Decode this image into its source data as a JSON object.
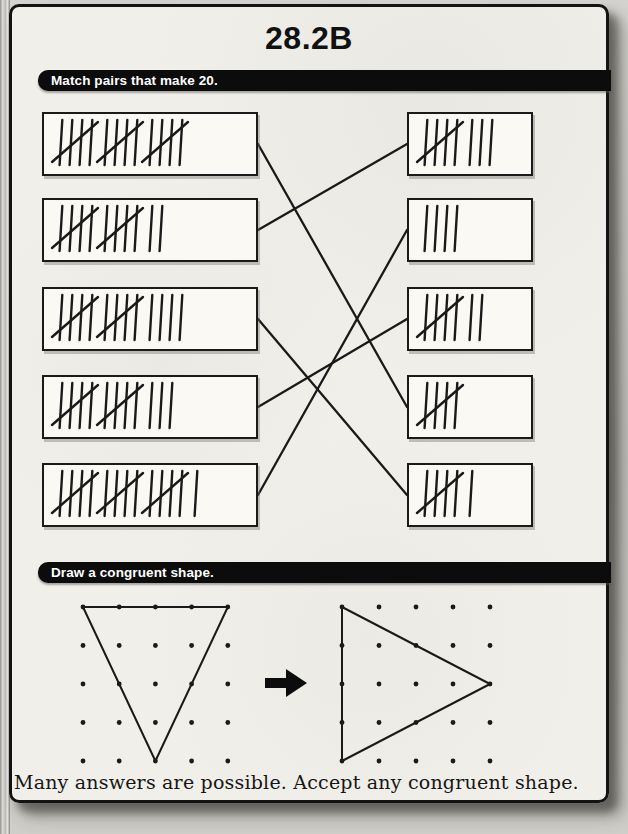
{
  "page": {
    "title": "28.2B"
  },
  "sections": {
    "match": {
      "heading": "Match pairs that make 20.",
      "target_sum": 20,
      "left_boxes": [
        {
          "value": 15,
          "groups": [
            5,
            5,
            5
          ]
        },
        {
          "value": 12,
          "groups": [
            5,
            5,
            2
          ]
        },
        {
          "value": 14,
          "groups": [
            5,
            5,
            4
          ]
        },
        {
          "value": 13,
          "groups": [
            5,
            5,
            3
          ]
        },
        {
          "value": 16,
          "groups": [
            5,
            5,
            5,
            1
          ]
        }
      ],
      "right_boxes": [
        {
          "value": 8,
          "groups": [
            5,
            3
          ]
        },
        {
          "value": 4,
          "groups": [
            4
          ]
        },
        {
          "value": 7,
          "groups": [
            5,
            2
          ]
        },
        {
          "value": 5,
          "groups": [
            5
          ]
        },
        {
          "value": 6,
          "groups": [
            5,
            1
          ]
        }
      ],
      "matches": [
        {
          "left": 0,
          "right": 3
        },
        {
          "left": 1,
          "right": 0
        },
        {
          "left": 2,
          "right": 4
        },
        {
          "left": 3,
          "right": 2
        },
        {
          "left": 4,
          "right": 1
        }
      ]
    },
    "congruent": {
      "heading": "Draw a congruent shape.",
      "note": "Many answers are possible. Accept any congruent shape.",
      "grid": {
        "rows": 5,
        "cols": 5
      },
      "example_triangle": [
        [
          0,
          0
        ],
        [
          4,
          0
        ],
        [
          2,
          4
        ]
      ],
      "answer_triangle": [
        [
          0,
          0
        ],
        [
          4,
          2
        ],
        [
          0,
          4
        ]
      ],
      "arrow_icon": "right-arrow"
    }
  },
  "colors": {
    "ink": "#1a1a1a",
    "paper": "#f1efe9",
    "bar_bg": "#0c0c0c",
    "bar_text": "#ffffff"
  }
}
